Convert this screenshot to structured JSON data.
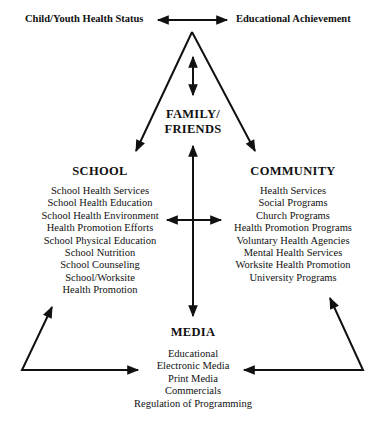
{
  "top": {
    "left_label": "Child/Youth Health Status",
    "right_label": "Educational Achievement"
  },
  "family": {
    "heading_line1": "FAMILY/",
    "heading_line2": "FRIENDS"
  },
  "school": {
    "heading": "SCHOOL",
    "items": [
      "School Health Services",
      "School Health Education",
      "School Health Environment",
      "Health Promotion Efforts",
      "School Physical Education",
      "School Nutrition",
      "School Counseling",
      "School/Worksite",
      "Health Promotion"
    ]
  },
  "community": {
    "heading": "COMMUNITY",
    "items": [
      "Health Services",
      "Social Programs",
      "Church Programs",
      "Health Promotion Programs",
      "Voluntary Health Agencies",
      "Mental Health Services",
      "Worksite Health Promotion",
      "University Programs"
    ]
  },
  "media": {
    "heading": "MEDIA",
    "items": [
      "Educational",
      "Electronic Media",
      "Print Media",
      "Commercials",
      "Regulation of Programming"
    ]
  }
}
